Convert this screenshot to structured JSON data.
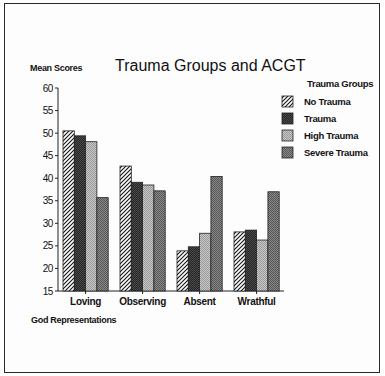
{
  "chart_data": {
    "type": "bar",
    "title": "Trauma Groups and ACGT",
    "ylabel": "Mean Scores",
    "xlabel": "God Representations",
    "ylim": [
      15,
      60
    ],
    "yticks": [
      15,
      20,
      25,
      30,
      35,
      40,
      45,
      50,
      55,
      60
    ],
    "grid": false,
    "legend_title": "Trauma Groups",
    "legend_position": "right",
    "categories": [
      "Loving",
      "Observing",
      "Absent",
      "Wrathful"
    ],
    "series": [
      {
        "name": "No Trauma",
        "values": [
          50.5,
          42.7,
          23.9,
          28.1
        ],
        "fill": "hatch",
        "color": "#ffffff"
      },
      {
        "name": "Trauma",
        "values": [
          49.4,
          39.1,
          24.8,
          28.5
        ],
        "fill": "dither",
        "color": "#262626"
      },
      {
        "name": "High Trauma",
        "values": [
          48.1,
          38.5,
          27.8,
          26.3
        ],
        "fill": "dither",
        "color": "#b9b9b9"
      },
      {
        "name": "Severe Trauma",
        "values": [
          35.7,
          37.2,
          40.4,
          37.0
        ],
        "fill": "dither",
        "color": "#727272"
      }
    ]
  }
}
